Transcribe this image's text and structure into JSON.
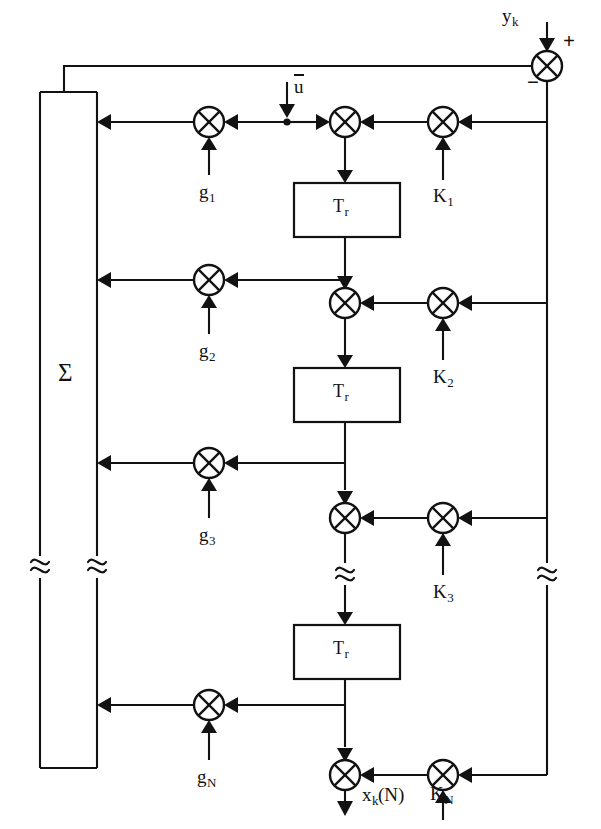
{
  "diagram": {
    "input_signal": {
      "label": "y",
      "subscript": "k"
    },
    "control_signal": {
      "label": "u",
      "overbar": true
    },
    "output_signal": {
      "label": "x",
      "subscript": "k",
      "suffix": "(N)"
    },
    "summing_junction": {
      "plus_sign": "+",
      "minus_sign": "−"
    },
    "summation_block": {
      "label": "Σ"
    },
    "delay_blocks": [
      {
        "label": "T",
        "subscript": "r"
      },
      {
        "label": "T",
        "subscript": "r"
      },
      {
        "label": "T",
        "subscript": "r"
      }
    ],
    "gain_taps": [
      {
        "label": "g",
        "subscript": "1"
      },
      {
        "label": "g",
        "subscript": "2"
      },
      {
        "label": "g",
        "subscript": "3"
      },
      {
        "label": "g",
        "subscript": "N"
      }
    ],
    "feedback_gains": [
      {
        "label": "K",
        "subscript": "1"
      },
      {
        "label": "K",
        "subscript": "2"
      },
      {
        "label": "K",
        "subscript": "3"
      },
      {
        "label": "K",
        "subscript": "N"
      }
    ],
    "colors": {
      "ink": "#121212",
      "paper": "#ffffff"
    }
  }
}
